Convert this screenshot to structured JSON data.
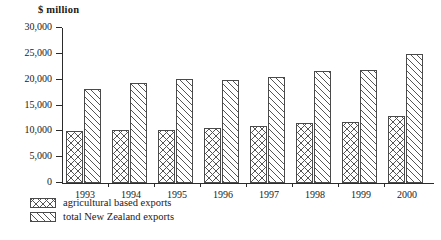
{
  "chart_data": {
    "type": "bar",
    "title": "",
    "ylabel": "$ million",
    "xlabel": "",
    "ylim": [
      0,
      30000
    ],
    "ytick_labels": [
      "30,000",
      "25,000",
      "20,000",
      "15,000",
      "10,000",
      "5,000",
      "0"
    ],
    "ytick_values": [
      30000,
      25000,
      20000,
      15000,
      10000,
      5000,
      0
    ],
    "grid": false,
    "legend_position": "below-axis-left",
    "categories": [
      "1993",
      "1994",
      "1995",
      "1996",
      "1997",
      "1998",
      "1999",
      "2000"
    ],
    "series": [
      {
        "name": "agricultural based exports",
        "pattern": "cross-hatch",
        "values": [
          10000,
          10200,
          10200,
          10600,
          11000,
          11700,
          11800,
          13000
        ]
      },
      {
        "name": "total New Zealand exports",
        "pattern": "diagonal-hatch",
        "values": [
          18200,
          19300,
          20200,
          20000,
          20500,
          21600,
          21800,
          25000
        ]
      }
    ]
  }
}
